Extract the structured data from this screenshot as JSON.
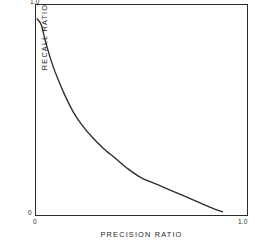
{
  "chart_data": {
    "type": "line",
    "title": "",
    "subtitle": "",
    "xlabel": "PRECISION RATIO",
    "ylabel": "RECALL RATIO",
    "xlim": [
      0,
      1.0
    ],
    "ylim": [
      0,
      1.0
    ],
    "grid": false,
    "legend": null,
    "xticks": [
      "0",
      "1.0"
    ],
    "yticks": [
      "0",
      "1.0"
    ],
    "xtick_values": [
      0,
      1.0
    ],
    "ytick_values": [
      0,
      1.0
    ],
    "annotations": [],
    "series": [
      {
        "name": "precision-recall tradeoff",
        "color": "#2b2b2b",
        "x": [
          0.01,
          0.03,
          0.05,
          0.08,
          0.11,
          0.14,
          0.18,
          0.22,
          0.27,
          0.32,
          0.38,
          0.44,
          0.5,
          0.57,
          0.64,
          0.71,
          0.78,
          0.85,
          0.88
        ],
        "y": [
          0.93,
          0.9,
          0.82,
          0.72,
          0.64,
          0.57,
          0.49,
          0.43,
          0.37,
          0.32,
          0.27,
          0.22,
          0.18,
          0.15,
          0.12,
          0.09,
          0.06,
          0.03,
          0.02
        ]
      }
    ]
  },
  "labels": {
    "y_max": "1.0",
    "y_min": "0",
    "x_min": "0",
    "x_max": "1.0"
  }
}
